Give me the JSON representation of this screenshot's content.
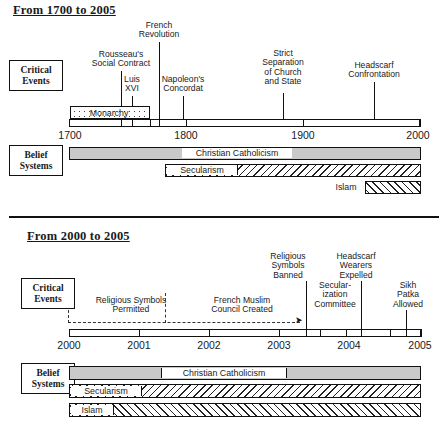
{
  "timelines": [
    {
      "title": "From 1700 to 2005",
      "rows": {
        "critical": "Critical\nEvents",
        "belief": "Belief\nSystems"
      },
      "axis": {
        "start": 1700,
        "end": 2000,
        "ticks": [
          "1700",
          "1800",
          "1900",
          "2000"
        ]
      },
      "events": [
        {
          "label": "Rousseau's\nSocial Contract",
          "year": 1762
        },
        {
          "label": "French\nRevolution",
          "year": 1789
        },
        {
          "label": "Luis\nXVI",
          "year": 1774
        },
        {
          "label": "Napoleon's\nConcordat",
          "year": 1801
        },
        {
          "label": "Strict\nSeparation\nof Church\nand State",
          "year": 1905
        },
        {
          "label": "Headscarf\nConfrontation",
          "year": 1989
        }
      ],
      "period_bars": [
        {
          "label": "Monarchy",
          "start": 1700,
          "end": 1792,
          "fill": "dots"
        }
      ],
      "belief_bars": [
        {
          "label": "Christian Catholicism",
          "start": 1700,
          "end": 2005,
          "fill": "grey"
        },
        {
          "label": "Secularism",
          "start": 1789,
          "end": 2005,
          "fill": "hatch-forward"
        },
        {
          "label": "Islam",
          "start": 1960,
          "end": 2005,
          "fill": "hatch-back"
        }
      ]
    },
    {
      "title": "From 2000 to 2005",
      "rows": {
        "critical": "Critical\nEvents",
        "belief": "Belief\nSystems"
      },
      "axis": {
        "start": 2000,
        "end": 2005,
        "ticks": [
          "2000",
          "2001",
          "2002",
          "2003",
          "2004",
          "2005"
        ]
      },
      "events": [
        {
          "label": "Religious Symbols\nPermitted",
          "year": 2000
        },
        {
          "label": "French Muslim\nCouncil Created",
          "year": 2002
        },
        {
          "label": "Religious\nSymbols\nBanned",
          "year": 2003.1
        },
        {
          "label": "Secular-\nization\nCommittee",
          "year": 2003.6
        },
        {
          "label": "Headscarf\nWearers\nExpelled",
          "year": 2003.8
        },
        {
          "label": "Sikh\nPatka\nAllowed",
          "year": 2004.7
        }
      ],
      "belief_bars": [
        {
          "label": "Christian Catholicism",
          "start": 2000,
          "end": 2005,
          "fill": "grey"
        },
        {
          "label": "Secularism",
          "start": 2000,
          "end": 2005,
          "fill": "hatch-forward"
        },
        {
          "label": "Islam",
          "start": 2000,
          "end": 2005,
          "fill": "hatch-back"
        }
      ]
    }
  ]
}
